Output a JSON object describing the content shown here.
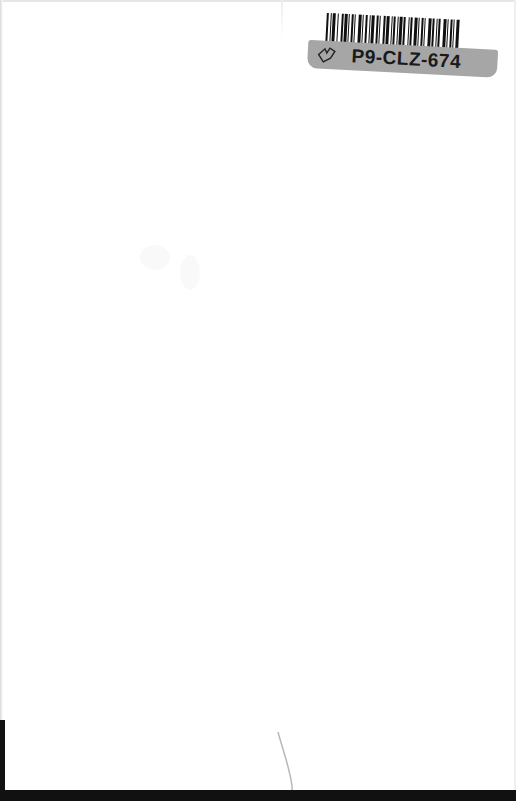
{
  "document": {
    "type": "scanned blank page",
    "sticker": {
      "code": "P9-CLZ-674",
      "icon": "heart-outline-icon"
    }
  },
  "colors": {
    "page_background": "#ffffff",
    "sticker_strip": "#a6a6a6",
    "barcode": "#111111",
    "border": "#111111"
  }
}
